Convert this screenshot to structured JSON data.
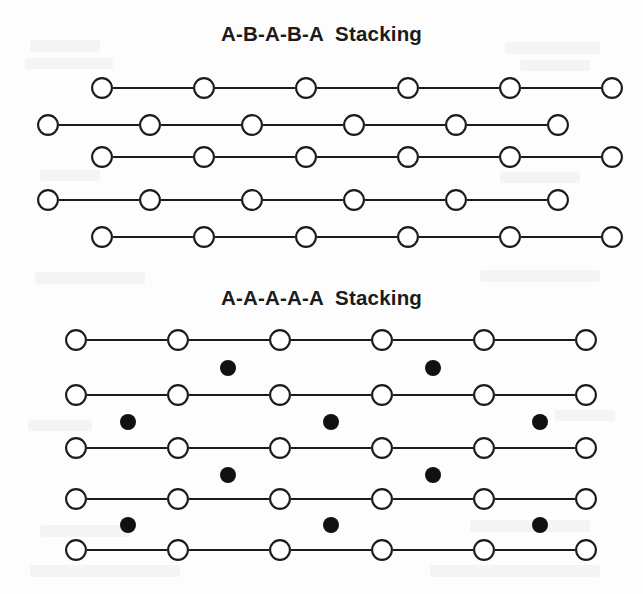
{
  "figure": {
    "caption_panels": 2,
    "background_color": "#fdfdfd",
    "ink_color": "#1b1b1b",
    "open_circle_fill": "#ffffff",
    "filled_dot_color": "#111111"
  },
  "panel_one": {
    "title": "A-B-A-B-A  Stacking",
    "title_y": 36,
    "stacking_sequence": [
      "A",
      "B",
      "A",
      "B",
      "A"
    ],
    "row_count": 5,
    "atoms_per_row": 6,
    "circle_diameter": 22,
    "circle_spacing": 102,
    "offset_shift": 54,
    "rows": [
      {
        "label": "A",
        "layer": 1,
        "y": 88,
        "start_x": 102,
        "atom_count": 6,
        "offset": "right"
      },
      {
        "label": "B",
        "layer": 2,
        "y": 125,
        "start_x": 48,
        "atom_count": 6,
        "offset": "left"
      },
      {
        "label": "A",
        "layer": 3,
        "y": 157,
        "start_x": 102,
        "atom_count": 6,
        "offset": "right"
      },
      {
        "label": "B",
        "layer": 4,
        "y": 200,
        "start_x": 48,
        "atom_count": 6,
        "offset": "left"
      },
      {
        "label": "A",
        "layer": 5,
        "y": 237,
        "start_x": 102,
        "atom_count": 6,
        "offset": "right"
      }
    ]
  },
  "panel_two": {
    "title": "A-A-A-A-A  Stacking",
    "title_y": 300,
    "stacking_sequence": [
      "A",
      "A",
      "A",
      "A",
      "A"
    ],
    "row_count": 5,
    "atoms_per_row": 6,
    "circle_diameter": 22,
    "circle_spacing": 102,
    "dot_diameter": 16,
    "rows": [
      {
        "label": "A",
        "layer": 1,
        "y": 340,
        "start_x": 76,
        "atom_count": 6,
        "offset": "none"
      },
      {
        "label": "A",
        "layer": 2,
        "y": 395,
        "start_x": 76,
        "atom_count": 6,
        "offset": "none"
      },
      {
        "label": "A",
        "layer": 3,
        "y": 448,
        "start_x": 76,
        "atom_count": 6,
        "offset": "none"
      },
      {
        "label": "A",
        "layer": 4,
        "y": 499,
        "start_x": 76,
        "atom_count": 6,
        "offset": "none"
      },
      {
        "label": "A",
        "layer": 5,
        "y": 550,
        "start_x": 76,
        "atom_count": 6,
        "offset": "none"
      }
    ],
    "interstitial_rows": [
      {
        "gap_index": 1,
        "y": 368,
        "x_positions": [
          228,
          433
        ]
      },
      {
        "gap_index": 2,
        "y": 422,
        "x_positions": [
          128,
          331,
          540
        ]
      },
      {
        "gap_index": 3,
        "y": 475,
        "x_positions": [
          228,
          433
        ]
      },
      {
        "gap_index": 4,
        "y": 525,
        "x_positions": [
          128,
          331,
          540
        ]
      }
    ]
  }
}
